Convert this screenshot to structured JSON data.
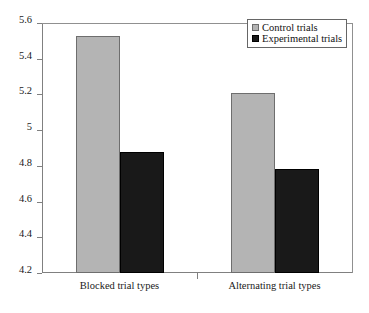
{
  "chart_data": {
    "type": "bar",
    "title": "",
    "xlabel": "",
    "ylabel": "",
    "categories": [
      "Blocked trial types",
      "Alternating trial types"
    ],
    "series": [
      {
        "name": "Control trials",
        "values": [
          5.53,
          5.21
        ],
        "color": "#b4b4b4"
      },
      {
        "name": "Experimental trials",
        "values": [
          4.88,
          4.78
        ],
        "color": "#191919"
      }
    ],
    "ylim": [
      4.2,
      5.6
    ],
    "yticks": [
      4.2,
      4.4,
      4.6,
      4.8,
      5,
      5.2,
      5.4,
      5.6
    ],
    "ytick_labels": [
      "4.2",
      "4.4",
      "4.6",
      "4.8",
      "5",
      "5.2",
      "5.4",
      "5.6"
    ],
    "grid": false,
    "legend_position": "top-right"
  },
  "legend": {
    "entries": [
      {
        "label": "Control trials",
        "swatch": "control-swatch"
      },
      {
        "label": "Experimental trials",
        "swatch": "experimental-swatch"
      }
    ]
  },
  "axes": {
    "y_labels": [
      "5.6",
      "5.4",
      "5.2",
      "5",
      "4.8",
      "4.6",
      "4.4",
      "4.2"
    ],
    "x_labels": [
      "Blocked trial types",
      "Alternating trial types"
    ]
  }
}
